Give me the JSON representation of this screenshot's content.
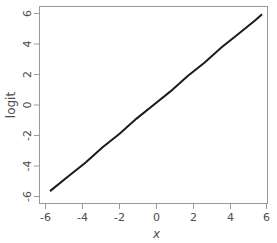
{
  "chart_data": {
    "type": "line",
    "title": "",
    "subtitle": "",
    "xlabel": "x",
    "ylabel": "logit",
    "xlim": [
      -6.75,
      6.75
    ],
    "ylim": [
      -6.55,
      6.55
    ],
    "xticks": [
      -6,
      -4,
      -2,
      0,
      2,
      4,
      6
    ],
    "xticklabels": [
      "-6",
      "-4",
      "-2",
      "0",
      "2",
      "4",
      "6"
    ],
    "yticks": [
      -6,
      -4,
      -2,
      0,
      2,
      4,
      6
    ],
    "yticklabels": [
      "-6",
      "-4",
      "-2",
      "0",
      "2",
      "4",
      "6"
    ],
    "grid": false,
    "legend": null,
    "legend_position": "none",
    "annotations": [],
    "series": [
      {
        "name": "logit",
        "color": "#1a1a1a",
        "linewidth": 2,
        "x": [
          -6.1,
          -5.0,
          -4.0,
          -3.0,
          -2.0,
          -1.0,
          0.0,
          1.0,
          2.0,
          3.0,
          4.0,
          5.0,
          6.0,
          6.4
        ],
        "values": [
          -5.7,
          -4.7,
          -3.8,
          -2.8,
          -1.9,
          -0.9,
          0.0,
          0.9,
          1.9,
          2.8,
          3.8,
          4.7,
          5.6,
          6.0
        ]
      }
    ],
    "frame": {
      "left": 39,
      "top": 6,
      "right": 268,
      "bottom": 204,
      "border_color": "#9a9a9a"
    },
    "tick_color": "#9a9a9a",
    "label_color": "#4d4d4d"
  }
}
